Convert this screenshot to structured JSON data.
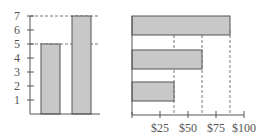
{
  "chart_data": [
    {
      "type": "bar",
      "orientation": "vertical",
      "title": "",
      "xlabel": "",
      "ylabel": "",
      "categories": [
        "A",
        "B"
      ],
      "values": [
        5,
        7
      ],
      "ylim": [
        0,
        7
      ],
      "yticks": [
        "1",
        "2",
        "3",
        "4",
        "5",
        "6",
        "7"
      ],
      "reference_lines": [
        5,
        7
      ],
      "grid": false,
      "colors": {
        "bar": "#c8c8c8",
        "bar_edge": "#555555",
        "axis": "#555555"
      }
    },
    {
      "type": "bar",
      "orientation": "horizontal",
      "title": "",
      "xlabel": "",
      "ylabel": "",
      "categories": [
        "top",
        "middle",
        "bottom"
      ],
      "values": [
        87.5,
        62.5,
        37.5
      ],
      "xlim": [
        0,
        100
      ],
      "xticks": [
        "$25",
        "$50",
        "$75",
        "$100"
      ],
      "reference_lines": [
        37.5,
        62.5,
        87.5
      ],
      "grid": false,
      "colors": {
        "bar": "#c8c8c8",
        "bar_edge": "#555555",
        "axis": "#555555"
      }
    }
  ]
}
